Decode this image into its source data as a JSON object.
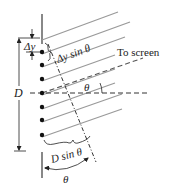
{
  "diagram": {
    "labels": {
      "delta_y": "Δy",
      "delta_y_sin_theta": "Δy sin θ",
      "to_screen": "To screen",
      "D": "D",
      "theta_top": "θ",
      "D_sin_theta": "D sin θ",
      "theta_bottom": "θ"
    },
    "slits": {
      "count": 7,
      "x": 42,
      "y_positions": [
        52,
        65,
        79,
        93,
        107,
        120,
        135
      ]
    },
    "colors": {
      "ray": "#9a9a9a",
      "wall": "#888888",
      "ink": "#222222",
      "dashed": "#333333"
    }
  }
}
